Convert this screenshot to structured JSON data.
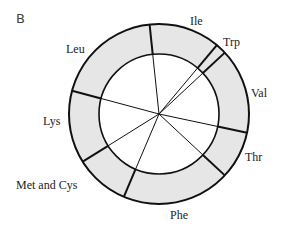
{
  "panel_label": "B",
  "diagram": {
    "type": "ring-wheel",
    "center": [
      159,
      114
    ],
    "outer_radius": 90,
    "inner_radius": 60,
    "ring_fill": "#e6e6e6",
    "line_color": "#111111",
    "segments": [
      {
        "name": "Ile",
        "label": "Ile",
        "start_deg": -6,
        "end_deg": 40,
        "label_pos": [
          196,
          25
        ]
      },
      {
        "name": "Trp",
        "label": "Trp",
        "start_deg": 40,
        "end_deg": 47,
        "label_pos": [
          224,
          47
        ]
      },
      {
        "name": "Val",
        "label": "Val",
        "start_deg": 47,
        "end_deg": 102,
        "label_pos": [
          251,
          97
        ]
      },
      {
        "name": "Thr",
        "label": "Thr",
        "start_deg": 102,
        "end_deg": 133,
        "label_pos": [
          246,
          162
        ]
      },
      {
        "name": "Phe",
        "label": "Phe",
        "start_deg": 133,
        "end_deg": 203,
        "label_pos": [
          170,
          219
        ]
      },
      {
        "name": "Met and Cys",
        "label": "Met and Cys",
        "start_deg": 203,
        "end_deg": 238,
        "label_pos": [
          16,
          189
        ]
      },
      {
        "name": "Lys",
        "label": "Lys",
        "start_deg": 238,
        "end_deg": 285,
        "label_pos": [
          43,
          125
        ]
      },
      {
        "name": "Leu",
        "label": "Leu",
        "start_deg": 285,
        "end_deg": 354,
        "label_pos": [
          66,
          53
        ]
      }
    ]
  },
  "labels": {
    "ile": "Ile",
    "trp": "Trp",
    "val": "Val",
    "thr": "Thr",
    "phe": "Phe",
    "met_cys": "Met and Cys",
    "lys": "Lys",
    "leu": "Leu"
  }
}
